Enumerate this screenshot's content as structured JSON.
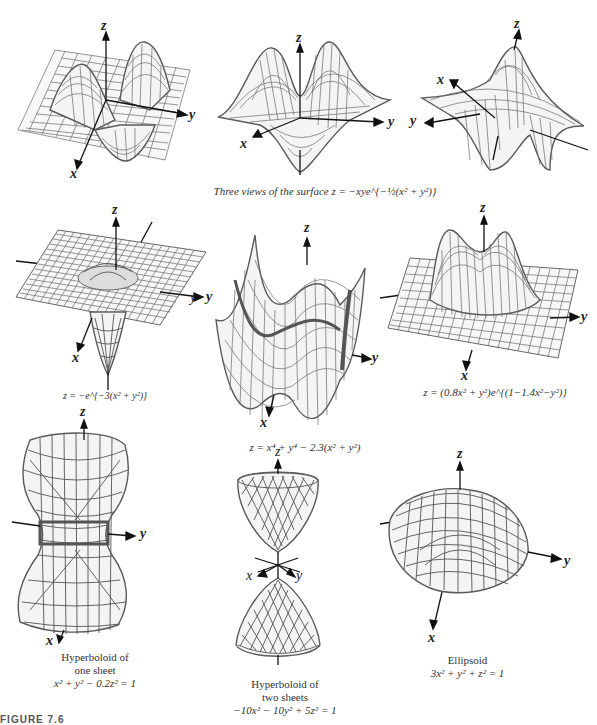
{
  "figure": {
    "label": "FIGURE 7.6",
    "panels": [
      {
        "id": "saddle-view-1",
        "caption": "",
        "axes": [
          "z",
          "y",
          "x"
        ]
      },
      {
        "id": "saddle-view-2",
        "caption": "Three views of the surface z = −xye^{−½(x² + y²)}",
        "axes": [
          "z",
          "y",
          "x"
        ]
      },
      {
        "id": "saddle-view-3",
        "caption": "",
        "axes": [
          "z",
          "x",
          "y"
        ]
      },
      {
        "id": "gaussian-well",
        "caption": "z = −e^{−3(x² + y²)}",
        "axes": [
          "z",
          "y",
          "x"
        ]
      },
      {
        "id": "quartic",
        "caption": "z = x⁴ + y⁴ − 2.3(x² + y²)",
        "axes": [
          "z",
          "y",
          "y",
          "x"
        ]
      },
      {
        "id": "twin-peaks",
        "caption": "z = (0.8x² + y²)e^{(1−1.4x²−y²)}",
        "axes": [
          "z",
          "y",
          "x"
        ]
      },
      {
        "id": "hyperboloid-one-sheet",
        "caption_lines": [
          "Hyperboloid of",
          "one sheet",
          "x² + y² − 0.2z² = 1"
        ],
        "axes": [
          "z",
          "y",
          "x"
        ]
      },
      {
        "id": "hyperboloid-two-sheets",
        "caption_lines": [
          "Hyperboloid of",
          "two sheets",
          "−10x² − 10y² + 5z² = 1"
        ],
        "axes": [
          "z",
          "x",
          "y"
        ]
      },
      {
        "id": "ellipsoid",
        "caption_lines": [
          "Ellipsoid",
          "3x² + y² + z² = 1"
        ],
        "axes": [
          "z",
          "y",
          "x"
        ]
      }
    ],
    "colors": {
      "mesh": "#6a6a6a",
      "axis": "#111111",
      "background": "#ffffff"
    }
  }
}
